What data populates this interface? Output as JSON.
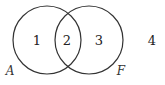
{
  "diagram": {
    "type": "venn",
    "stroke_color": "#333333",
    "background": "#ffffff",
    "sets": [
      {
        "name": "A",
        "label": "A",
        "cx": 47,
        "cy": 40,
        "r": 34
      },
      {
        "name": "F",
        "label": "F",
        "cx": 89,
        "cy": 40,
        "r": 34
      }
    ],
    "regions": [
      {
        "id": "1",
        "label": "1",
        "description": "A only",
        "x": 37,
        "y": 45
      },
      {
        "id": "2",
        "label": "2",
        "description": "A and F",
        "x": 67,
        "y": 45
      },
      {
        "id": "3",
        "label": "3",
        "description": "F only",
        "x": 99,
        "y": 45
      },
      {
        "id": "4",
        "label": "4",
        "description": "outside A and F",
        "x": 152,
        "y": 45
      }
    ],
    "set_label_positions": {
      "A": {
        "x": 10,
        "y": 75
      },
      "F": {
        "x": 121,
        "y": 75
      }
    }
  }
}
